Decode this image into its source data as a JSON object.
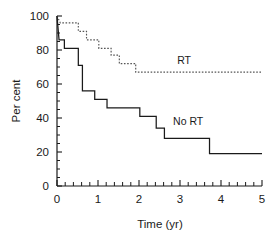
{
  "chart_data": {
    "type": "line",
    "title": "",
    "xlabel": "Time (yr)",
    "ylabel": "Per cent",
    "xlim": [
      0,
      5
    ],
    "ylim": [
      0,
      100
    ],
    "xticks": [
      0,
      1,
      2,
      3,
      4,
      5
    ],
    "xticklabels": [
      "0",
      "1",
      "2",
      "3",
      "4",
      "5"
    ],
    "yticks": [
      0,
      20,
      40,
      60,
      80,
      100
    ],
    "yticklabels": [
      "0",
      "20",
      "40",
      "60",
      "80",
      "100"
    ],
    "x_minor_tick_interval": 0.2,
    "y_minor_tick_interval": 5,
    "grid": false,
    "legend_position": "inline-annotation",
    "series": [
      {
        "name": "RT",
        "style": "dotted",
        "color": "#555555",
        "label_x": 3.1,
        "label_y": 72,
        "steps": [
          [
            0.0,
            100
          ],
          [
            0.08,
            96
          ],
          [
            0.52,
            96
          ],
          [
            0.52,
            91
          ],
          [
            0.72,
            91
          ],
          [
            0.72,
            86
          ],
          [
            1.02,
            86
          ],
          [
            1.02,
            81
          ],
          [
            1.32,
            81
          ],
          [
            1.32,
            77
          ],
          [
            1.52,
            77
          ],
          [
            1.52,
            72
          ],
          [
            1.92,
            72
          ],
          [
            1.92,
            67
          ],
          [
            5.0,
            67
          ]
        ]
      },
      {
        "name": "No RT",
        "style": "solid",
        "color": "#1a1a1a",
        "label_x": 3.2,
        "label_y": 36,
        "steps": [
          [
            0.0,
            100
          ],
          [
            0.05,
            86
          ],
          [
            0.18,
            86
          ],
          [
            0.18,
            81
          ],
          [
            0.52,
            81
          ],
          [
            0.52,
            71
          ],
          [
            0.62,
            71
          ],
          [
            0.62,
            56
          ],
          [
            0.92,
            56
          ],
          [
            0.92,
            51
          ],
          [
            1.22,
            51
          ],
          [
            1.22,
            46
          ],
          [
            2.02,
            46
          ],
          [
            2.02,
            41
          ],
          [
            2.42,
            41
          ],
          [
            2.42,
            34
          ],
          [
            2.62,
            34
          ],
          [
            2.62,
            28
          ],
          [
            3.72,
            28
          ],
          [
            3.72,
            19
          ],
          [
            5.0,
            19
          ]
        ]
      }
    ]
  }
}
